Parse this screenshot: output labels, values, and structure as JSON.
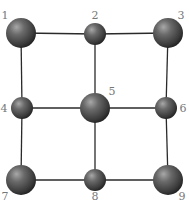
{
  "diagram": {
    "type": "grid-graph",
    "colors": {
      "background": "#ffffff",
      "edge": "#2a2a2a",
      "sphere_light": "#9a9a9a",
      "sphere_mid": "#5a5a5a",
      "sphere_dark": "#262626",
      "label": "#777777"
    },
    "nodes": [
      {
        "id": "1",
        "label": "1",
        "cx": 21,
        "cy": 33,
        "r": 15,
        "lx": 5,
        "ly": 19,
        "anchor": "middle"
      },
      {
        "id": "2",
        "label": "2",
        "cx": 95,
        "cy": 34,
        "r": 11,
        "lx": 95,
        "ly": 19,
        "anchor": "middle"
      },
      {
        "id": "3",
        "label": "3",
        "cx": 168,
        "cy": 33,
        "r": 15,
        "lx": 181,
        "ly": 19,
        "anchor": "middle"
      },
      {
        "id": "4",
        "label": "4",
        "cx": 22,
        "cy": 108,
        "r": 11,
        "lx": 4,
        "ly": 112,
        "anchor": "middle"
      },
      {
        "id": "5",
        "label": "5",
        "cx": 95,
        "cy": 108,
        "r": 15,
        "lx": 112,
        "ly": 95,
        "anchor": "middle"
      },
      {
        "id": "6",
        "label": "6",
        "cx": 166,
        "cy": 108,
        "r": 11,
        "lx": 183,
        "ly": 112,
        "anchor": "middle"
      },
      {
        "id": "7",
        "label": "7",
        "cx": 21,
        "cy": 180,
        "r": 15,
        "lx": 5,
        "ly": 200,
        "anchor": "middle"
      },
      {
        "id": "8",
        "label": "8",
        "cx": 95,
        "cy": 180,
        "r": 11,
        "lx": 95,
        "ly": 200,
        "anchor": "middle"
      },
      {
        "id": "9",
        "label": "9",
        "cx": 168,
        "cy": 180,
        "r": 15,
        "lx": 182,
        "ly": 200,
        "anchor": "middle"
      }
    ],
    "edges": [
      {
        "from": "1",
        "to": "2"
      },
      {
        "from": "2",
        "to": "3"
      },
      {
        "from": "1",
        "to": "4"
      },
      {
        "from": "2",
        "to": "5"
      },
      {
        "from": "3",
        "to": "6"
      },
      {
        "from": "4",
        "to": "5"
      },
      {
        "from": "5",
        "to": "6"
      },
      {
        "from": "4",
        "to": "7"
      },
      {
        "from": "5",
        "to": "8"
      },
      {
        "from": "6",
        "to": "9"
      },
      {
        "from": "7",
        "to": "8"
      },
      {
        "from": "8",
        "to": "9"
      }
    ]
  }
}
